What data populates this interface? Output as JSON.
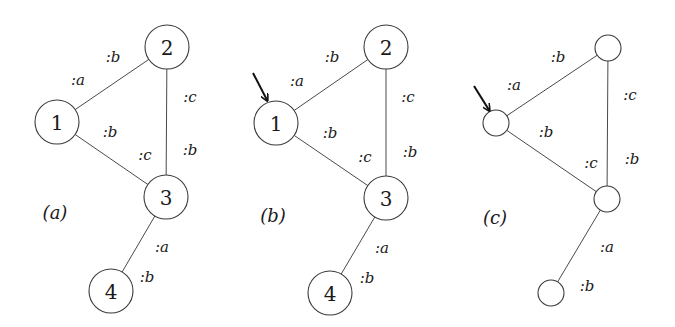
{
  "panels": [
    {
      "id": "a",
      "caption": "(a)",
      "caption_pos": [
        55,
        212
      ],
      "arrow": null,
      "node_radius": 22,
      "nodes": [
        {
          "label": "1",
          "x": 57,
          "y": 122
        },
        {
          "label": "2",
          "x": 167,
          "y": 47
        },
        {
          "label": "3",
          "x": 166,
          "y": 197
        },
        {
          "label": "4",
          "x": 111,
          "y": 291
        }
      ],
      "edges": [
        {
          "from": 0,
          "to": 1
        },
        {
          "from": 0,
          "to": 2
        },
        {
          "from": 1,
          "to": 2
        },
        {
          "from": 2,
          "to": 3
        }
      ],
      "edge_labels": [
        {
          "text": ":b",
          "x": 113,
          "y": 57
        },
        {
          "text": ":a",
          "x": 78,
          "y": 80
        },
        {
          "text": ":c",
          "x": 190,
          "y": 97
        },
        {
          "text": ":b",
          "x": 110,
          "y": 132
        },
        {
          "text": ":b",
          "x": 190,
          "y": 150
        },
        {
          "text": ":c",
          "x": 145,
          "y": 155
        },
        {
          "text": ":a",
          "x": 162,
          "y": 247
        },
        {
          "text": ":b",
          "x": 147,
          "y": 277
        }
      ]
    },
    {
      "id": "b",
      "caption": "(b)",
      "caption_pos": [
        273,
        215
      ],
      "arrow": {
        "x1": 253,
        "y1": 73,
        "x2": 267,
        "y2": 100
      },
      "node_radius": 22,
      "nodes": [
        {
          "label": "1",
          "x": 276,
          "y": 123
        },
        {
          "label": "2",
          "x": 386,
          "y": 47
        },
        {
          "label": "3",
          "x": 386,
          "y": 198
        },
        {
          "label": "4",
          "x": 330,
          "y": 293
        }
      ],
      "edges": [
        {
          "from": 0,
          "to": 1
        },
        {
          "from": 0,
          "to": 2
        },
        {
          "from": 1,
          "to": 2
        },
        {
          "from": 2,
          "to": 3
        }
      ],
      "edge_labels": [
        {
          "text": ":b",
          "x": 332,
          "y": 57
        },
        {
          "text": ":a",
          "x": 297,
          "y": 81
        },
        {
          "text": ":c",
          "x": 408,
          "y": 97
        },
        {
          "text": ":b",
          "x": 330,
          "y": 133
        },
        {
          "text": ":b",
          "x": 410,
          "y": 152
        },
        {
          "text": ":c",
          "x": 365,
          "y": 157
        },
        {
          "text": ":a",
          "x": 382,
          "y": 248
        },
        {
          "text": ":b",
          "x": 367,
          "y": 278
        }
      ]
    },
    {
      "id": "c",
      "caption": "(c)",
      "caption_pos": [
        495,
        217
      ],
      "arrow": {
        "x1": 474,
        "y1": 86,
        "x2": 489,
        "y2": 110
      },
      "node_radius": 13,
      "nodes": [
        {
          "label": "",
          "x": 496,
          "y": 123
        },
        {
          "label": "",
          "x": 608,
          "y": 48
        },
        {
          "label": "",
          "x": 607,
          "y": 199
        },
        {
          "label": "",
          "x": 551,
          "y": 293
        }
      ],
      "edges": [
        {
          "from": 0,
          "to": 1
        },
        {
          "from": 0,
          "to": 2
        },
        {
          "from": 1,
          "to": 2
        },
        {
          "from": 2,
          "to": 3
        }
      ],
      "edge_labels": [
        {
          "text": ":b",
          "x": 558,
          "y": 57
        },
        {
          "text": ":a",
          "x": 514,
          "y": 85
        },
        {
          "text": ":c",
          "x": 630,
          "y": 95
        },
        {
          "text": ":b",
          "x": 546,
          "y": 132
        },
        {
          "text": ":b",
          "x": 632,
          "y": 159
        },
        {
          "text": ":c",
          "x": 591,
          "y": 163
        },
        {
          "text": ":a",
          "x": 607,
          "y": 247
        },
        {
          "text": ":b",
          "x": 587,
          "y": 286
        }
      ]
    }
  ]
}
